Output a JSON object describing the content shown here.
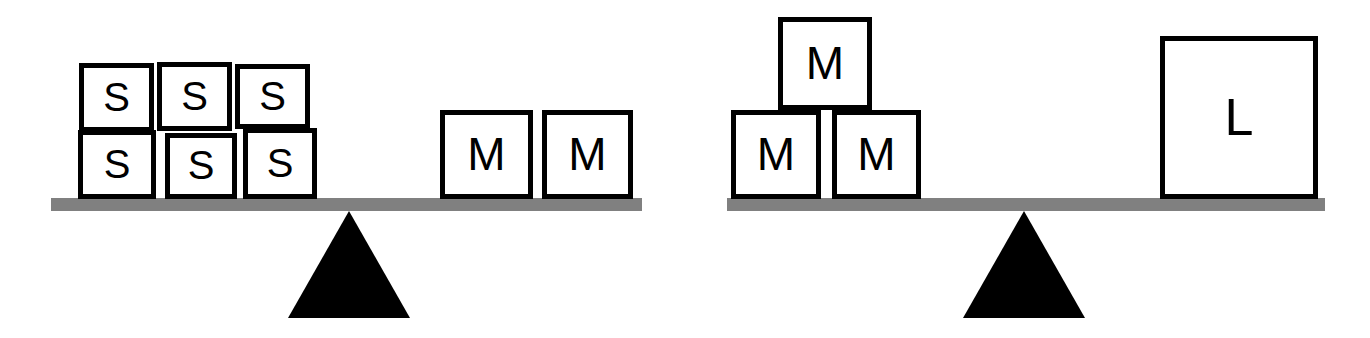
{
  "figure": {
    "colors": {
      "block_fill": "#ffffff",
      "block_stroke": "#000000",
      "beam": "#808080",
      "fulcrum": "#000000",
      "background": "#ffffff"
    }
  },
  "chart_data": {
    "type": "diagram",
    "scales": [
      {
        "name": "left-balance",
        "state": "balanced",
        "left_pan": {
          "label": "S",
          "count": 6,
          "arrangement": "2 rows of 3"
        },
        "right_pan": {
          "label": "M",
          "count": 2,
          "arrangement": "1 row of 2"
        }
      },
      {
        "name": "right-balance",
        "state": "balanced",
        "left_pan": {
          "label": "M",
          "count": 3,
          "arrangement": "2 on bottom, 1 on top"
        },
        "right_pan": {
          "label": "L",
          "count": 1,
          "arrangement": "single large block"
        }
      }
    ]
  },
  "scales": [
    {
      "name": "left-balance",
      "beam": {
        "x": 51,
        "y": 198,
        "width": 591,
        "height": 13
      },
      "fulcrum": {
        "x": 288,
        "y": 211,
        "width": 122,
        "height": 107
      },
      "blocks": [
        {
          "id": "s1",
          "label": "S",
          "size": "small",
          "x": 79,
          "y": 63,
          "w": 75,
          "h": 69
        },
        {
          "id": "s2",
          "label": "S",
          "size": "small",
          "x": 157,
          "y": 62,
          "w": 75,
          "h": 69
        },
        {
          "id": "s3",
          "label": "S",
          "size": "small",
          "x": 235,
          "y": 64,
          "w": 75,
          "h": 65
        },
        {
          "id": "s4",
          "label": "S",
          "size": "small",
          "x": 78,
          "y": 130,
          "w": 78,
          "h": 69
        },
        {
          "id": "s5",
          "label": "S",
          "size": "small",
          "x": 165,
          "y": 133,
          "w": 72,
          "h": 66
        },
        {
          "id": "s6",
          "label": "S",
          "size": "small",
          "x": 243,
          "y": 128,
          "w": 74,
          "h": 71
        },
        {
          "id": "m1",
          "label": "M",
          "size": "medium",
          "x": 440,
          "y": 110,
          "w": 93,
          "h": 89
        },
        {
          "id": "m2",
          "label": "M",
          "size": "medium",
          "x": 542,
          "y": 110,
          "w": 91,
          "h": 89
        }
      ]
    },
    {
      "name": "right-balance",
      "beam": {
        "x": 727,
        "y": 198,
        "width": 598,
        "height": 13
      },
      "fulcrum": {
        "x": 963,
        "y": 211,
        "width": 122,
        "height": 107
      },
      "blocks": [
        {
          "id": "rm-top",
          "label": "M",
          "size": "medium",
          "x": 778,
          "y": 17,
          "w": 94,
          "h": 93
        },
        {
          "id": "rm-left",
          "label": "M",
          "size": "medium",
          "x": 731,
          "y": 110,
          "w": 90,
          "h": 89
        },
        {
          "id": "rm-right",
          "label": "M",
          "size": "medium",
          "x": 832,
          "y": 110,
          "w": 89,
          "h": 89
        },
        {
          "id": "rl-large",
          "label": "L",
          "size": "large",
          "x": 1160,
          "y": 36,
          "w": 158,
          "h": 163
        }
      ]
    }
  ]
}
